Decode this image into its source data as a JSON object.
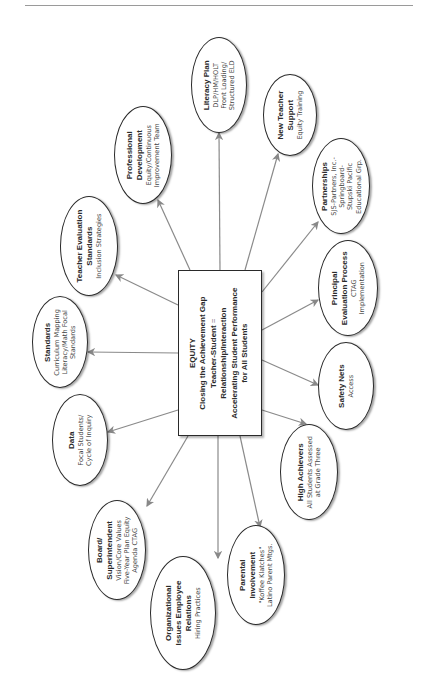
{
  "diagram": {
    "center": {
      "lines": [
        "EQUITY",
        "Closing the Achievement Gap",
        "Teacher-Student",
        "Relationship/Interaction",
        "Accelerating Student Performance",
        "for All Students"
      ],
      "equals": "="
    },
    "nodes": [
      {
        "id": "literacy-plan",
        "title": "Literacy Plan",
        "subtitle": [
          "DLP/HM/HOLT",
          "Front Loading/",
          "Structured ELD"
        ]
      },
      {
        "id": "new-teacher-support",
        "title": "New Teacher Support",
        "title_lines": [
          "New Teacher",
          "Support"
        ],
        "subtitle": [
          "Equity Training"
        ]
      },
      {
        "id": "partnerships",
        "title": "Partnerships",
        "subtitle": [
          "SJS-Partners, Inc.-",
          "Springboard-",
          "Stupski Pacific",
          "Educational Grp."
        ]
      },
      {
        "id": "principal-evaluation",
        "title": "Principal Evaluation Process",
        "title_lines": [
          "Principal",
          "Evaluation Process"
        ],
        "subtitle": [
          "CTAG",
          "Implementation"
        ]
      },
      {
        "id": "safety-nets",
        "title": "Safety Nets",
        "subtitle": [
          "Access"
        ]
      },
      {
        "id": "high-achievers",
        "title": "High Achievers",
        "subtitle": [
          "All Students Assessed",
          "at Grade Three"
        ]
      },
      {
        "id": "parental-involvement",
        "title": "Parental Involvement",
        "title_lines": [
          "Parental",
          "Involvement"
        ],
        "subtitle": [
          "\"Koffee Klatches\"",
          "Latino Parent Mtgs."
        ]
      },
      {
        "id": "organizational-issues",
        "title": "Organizational Issues Employee Relations",
        "title_lines": [
          "Organizational",
          "Issues Employee",
          "Relations"
        ],
        "subtitle": [
          "Hiring Practices"
        ]
      },
      {
        "id": "board-superintendent",
        "title": "Board/Superintendent",
        "title_lines": [
          "Board/",
          "Superintendent"
        ],
        "subtitle": [
          "Vision/Core Values",
          "Five-Year Plan Equity",
          "Agenda CTAG"
        ]
      },
      {
        "id": "data",
        "title": "Data",
        "subtitle": [
          "Focal Students/",
          "Cycle of Inquiry"
        ]
      },
      {
        "id": "standards",
        "title": "Standards",
        "subtitle": [
          "Curriculum Mapping",
          "Literacy/Math Focal",
          "Standards"
        ]
      },
      {
        "id": "teacher-evaluation",
        "title": "Teacher Evaluation Standards",
        "title_lines": [
          "Teacher Evaluation",
          "Standards"
        ],
        "subtitle": [
          "Inclusion Strategies"
        ]
      },
      {
        "id": "professional-development",
        "title": "Professional Development",
        "title_lines": [
          "Professional",
          "Development"
        ],
        "subtitle": [
          "Equity/Continuous",
          "Improvement Team"
        ]
      }
    ]
  },
  "t": {
    "lp": [
      "Literacy Plan",
      "DLP/HM/HOLT",
      "Front Loading/",
      "Structured ELD"
    ],
    "nt": [
      "New Teacher",
      "Support",
      "Equity Training"
    ],
    "pa": [
      "Partnerships",
      "SJS-Partners, Inc.-",
      "Springboard-",
      "Stupski Pacific",
      "Educational Grp."
    ],
    "pe": [
      "Principal",
      "Evaluation Process",
      "CTAG",
      "Implementation"
    ],
    "sn": [
      "Safety Nets",
      "Access"
    ],
    "ha": [
      "High Achievers",
      "All Students Assessed",
      "at Grade Three"
    ],
    "pi": [
      "Parental",
      "Involvement",
      "\"Koffee Klatches\"",
      "Latino Parent Mtgs."
    ],
    "oi": [
      "Organizational",
      "Issues Employee",
      "Relations",
      "Hiring Practices"
    ],
    "bs": [
      "Board/",
      "Superintendent",
      "Vision/Core Values",
      "Five-Year Plan Equity",
      "Agenda CTAG"
    ],
    "da": [
      "Data",
      "Focal Students/",
      "Cycle of Inquiry"
    ],
    "st": [
      "Standards",
      "Curriculum Mapping",
      "Literacy/Math Focal",
      "Standards"
    ],
    "te": [
      "Teacher Evaluation",
      "Standards",
      "Inclusion Strategies"
    ],
    "pd": [
      "Professional",
      "Development",
      "Equity/Continuous",
      "Improvement Team"
    ]
  }
}
